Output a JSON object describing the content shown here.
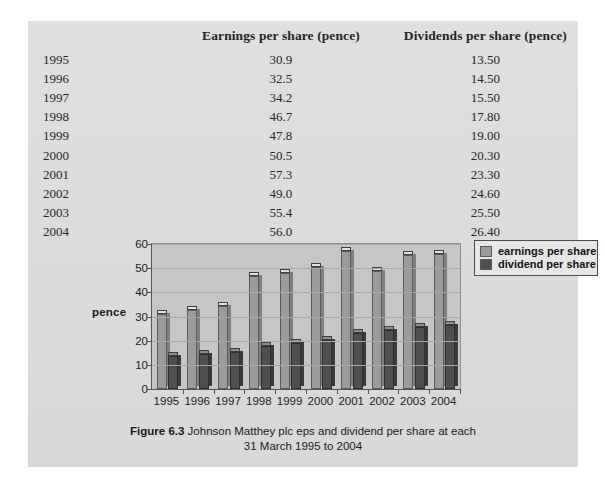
{
  "page": {
    "background_color": "#dcdcdc",
    "canvas_color": "#ffffff"
  },
  "table": {
    "headers": {
      "year": "",
      "eps": "Earnings per share (pence)",
      "dps": "Dividends per share (pence)"
    },
    "rows": [
      {
        "year": "1995",
        "eps": "30.9",
        "dps": "13.50"
      },
      {
        "year": "1996",
        "eps": "32.5",
        "dps": "14.50"
      },
      {
        "year": "1997",
        "eps": "34.2",
        "dps": "15.50"
      },
      {
        "year": "1998",
        "eps": "46.7",
        "dps": "17.80"
      },
      {
        "year": "1999",
        "eps": "47.8",
        "dps": "19.00"
      },
      {
        "year": "2000",
        "eps": "50.5",
        "dps": "20.30"
      },
      {
        "year": "2001",
        "eps": "57.3",
        "dps": "23.30"
      },
      {
        "year": "2002",
        "eps": "49.0",
        "dps": "24.60"
      },
      {
        "year": "2003",
        "eps": "55.4",
        "dps": "25.50"
      },
      {
        "year": "2004",
        "eps": "56.0",
        "dps": "26.40"
      }
    ]
  },
  "figure": {
    "caption_label": "Figure 6.3",
    "caption_line1": "Johnson Matthey plc eps and dividend per share at each",
    "caption_line2": "31 March 1995 to 2004"
  },
  "chart_data": {
    "type": "bar",
    "title": "Johnson Matthey plc eps and dividend per share at each 31 March 1995 to 2004",
    "categories": [
      "1995",
      "1996",
      "1997",
      "1998",
      "1999",
      "2000",
      "2001",
      "2002",
      "2003",
      "2004"
    ],
    "series": [
      {
        "name": "earnings per share",
        "color": "#9b9b9b",
        "values": [
          30.9,
          32.5,
          34.2,
          46.7,
          47.8,
          50.5,
          57.3,
          49.0,
          55.4,
          56.0
        ]
      },
      {
        "name": "dividend per share",
        "color": "#4f4f4f",
        "values": [
          13.5,
          14.5,
          15.5,
          17.8,
          19.0,
          20.3,
          23.3,
          24.6,
          25.5,
          26.4
        ]
      }
    ],
    "xlabel": "",
    "ylabel": "pence",
    "ylim": [
      0,
      60
    ],
    "yticks": [
      0,
      10,
      20,
      30,
      40,
      50,
      60
    ],
    "grid": true,
    "legend_position": "right",
    "plot_background": "#c6c6c6"
  }
}
